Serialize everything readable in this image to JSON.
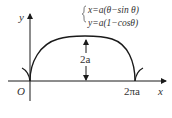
{
  "diagram": {
    "equations": {
      "x": "x=a(θ−sin θ)",
      "y": "y=a(1−cosθ)"
    },
    "labels": {
      "y_axis": "y",
      "x_axis": "x",
      "origin": "O",
      "end": "2πa",
      "height": "2a"
    },
    "colors": {
      "stroke": "#1a1a1a",
      "text": "#333333",
      "background": "#ffffff"
    }
  }
}
